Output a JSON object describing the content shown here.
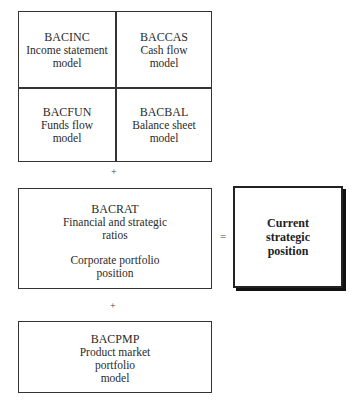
{
  "diagram": {
    "grid": {
      "cells": [
        {
          "code": "BACINC",
          "lines": [
            "Income statement",
            "model"
          ]
        },
        {
          "code": "BACCAS",
          "lines": [
            "Cash flow",
            "model"
          ]
        },
        {
          "code": "BACFUN",
          "lines": [
            "Funds flow",
            "model"
          ]
        },
        {
          "code": "BACBAL",
          "lines": [
            "Balance sheet",
            "model"
          ]
        }
      ]
    },
    "operators": {
      "plus_1": "+",
      "plus_2": "+",
      "equals": "="
    },
    "ratios_box": {
      "code": "BACRAT",
      "lines": [
        "Financial and strategic",
        "ratios"
      ],
      "second_lines": [
        "Corporate portfolio",
        "position"
      ]
    },
    "result_box": {
      "lines": [
        "Current",
        "strategic",
        "position"
      ]
    },
    "pmp_box": {
      "code": "BACPMP",
      "lines": [
        "Product market",
        "portfolio",
        "model"
      ]
    }
  }
}
